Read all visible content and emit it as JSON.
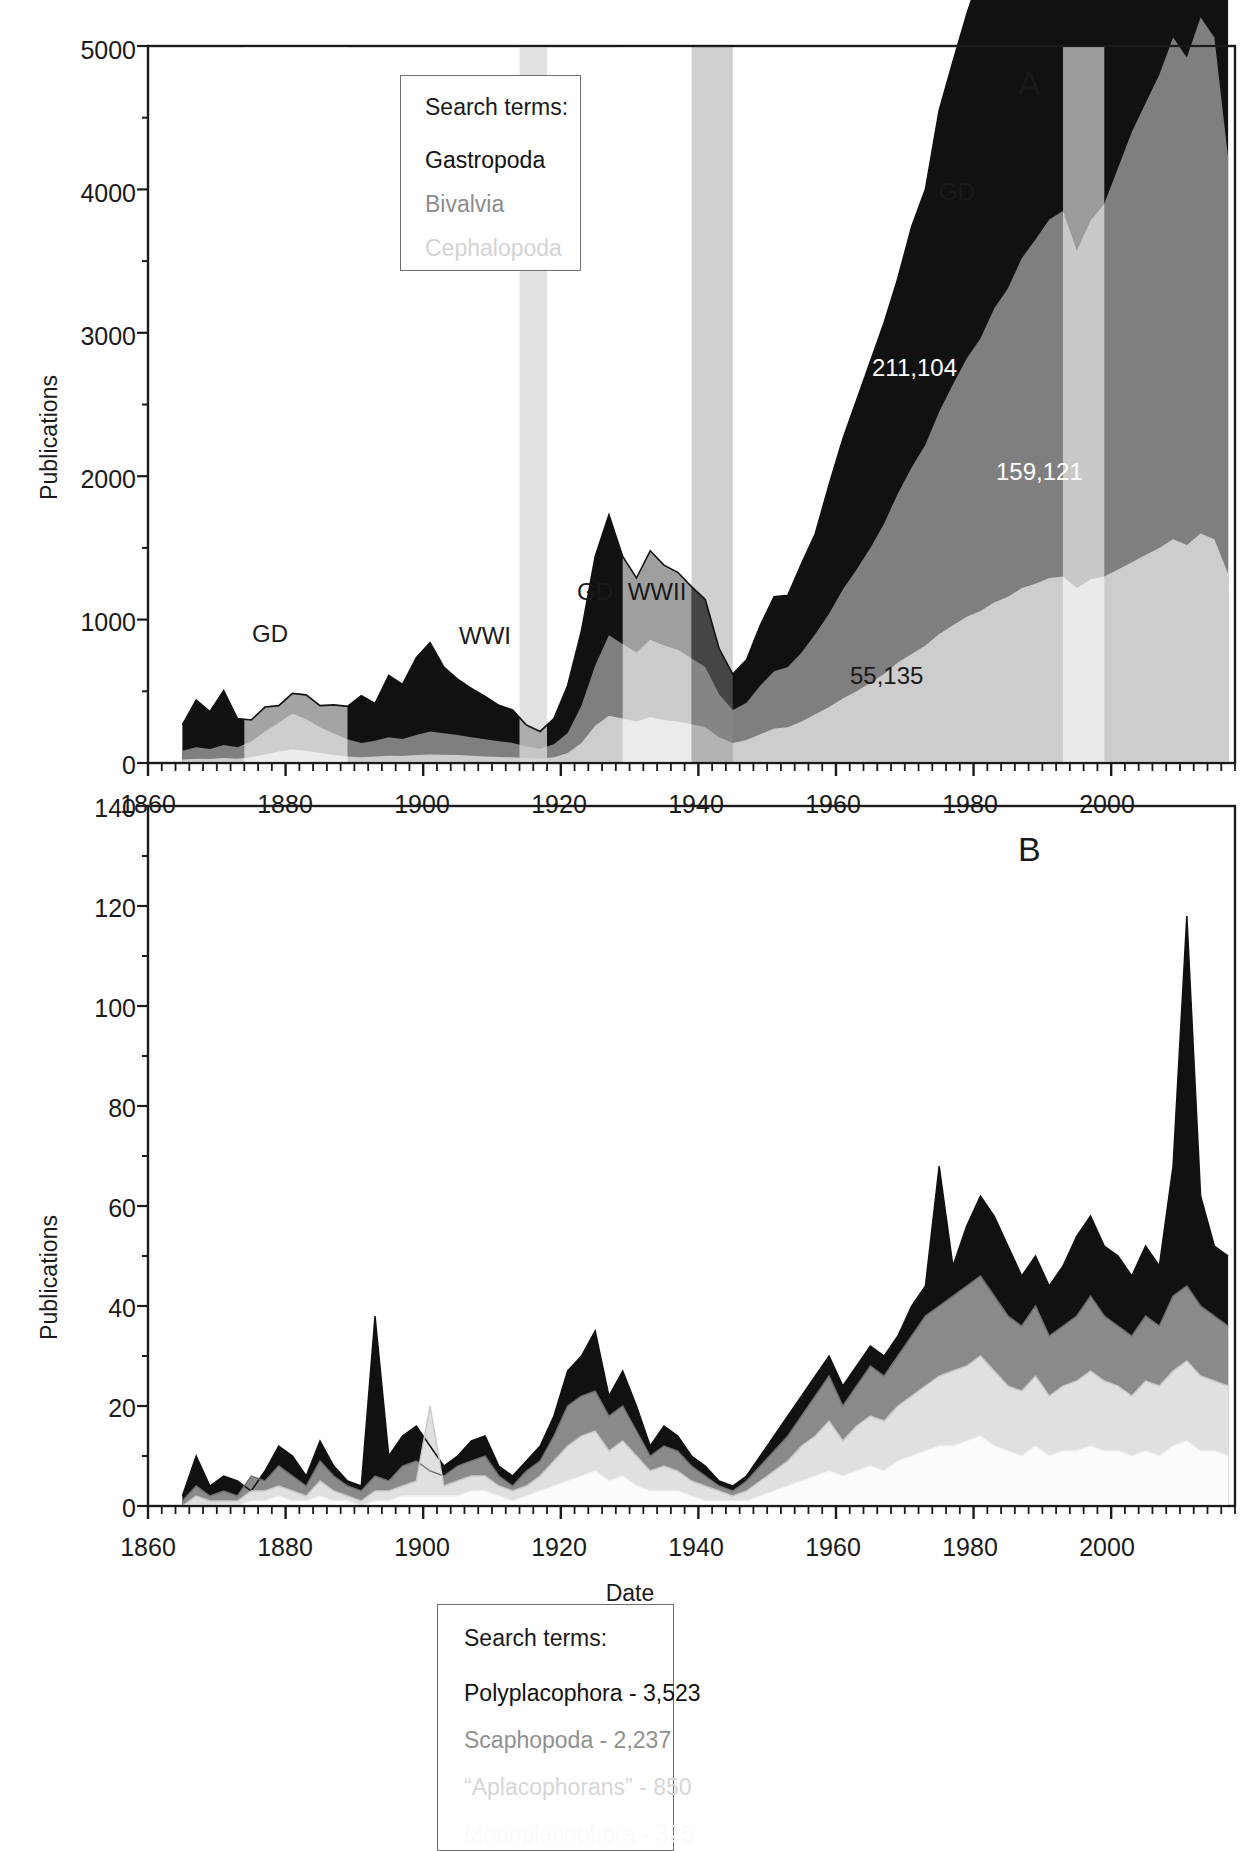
{
  "figure": {
    "panels": [
      "A",
      "B"
    ],
    "shared_xlabel": "Date"
  },
  "panelA": {
    "letter": "A",
    "ylabel": "Publications",
    "legend": {
      "title": "Search terms:",
      "entries": [
        {
          "label": "Gastropoda",
          "color": "#111111"
        },
        {
          "label": "Bivalvia",
          "color": "#7f7f7f"
        },
        {
          "label": "Cephalopoda",
          "color": "#cdcdcd"
        }
      ]
    },
    "event_bands": [
      {
        "label": "GD",
        "start": 1874,
        "end": 1889,
        "shade": "#ececec"
      },
      {
        "label": "WWI",
        "start": 1914,
        "end": 1918,
        "shade": "#bdbdbd"
      },
      {
        "label": "GD",
        "start": 1929,
        "end": 1939,
        "shade": "#ececec"
      },
      {
        "label": "WWII",
        "start": 1939,
        "end": 1945,
        "shade": "#b0b0b0"
      },
      {
        "label": "GD",
        "start": 1993,
        "end": 1999,
        "shade": "#e2e2e2"
      }
    ],
    "annotations": [
      {
        "text": "211,104",
        "series": "Gastropoda",
        "color": "#ffffff"
      },
      {
        "text": "159,121",
        "series": "Bivalvia",
        "color": "#ffffff"
      },
      {
        "text": "55,135",
        "series": "Cephalopoda",
        "color": "#2a2a2a"
      }
    ],
    "yticks": [
      0,
      1000,
      2000,
      3000,
      4000,
      5000
    ],
    "xticks": [
      1860,
      1880,
      1900,
      1920,
      1940,
      1960,
      1980,
      2000
    ]
  },
  "panelB": {
    "letter": "B",
    "ylabel": "Publications",
    "xlabel": "Date",
    "legend": {
      "title": "Search terms:",
      "entries": [
        {
          "label": "Polyplacophora - 3,523",
          "color": "#111111"
        },
        {
          "label": "Scaphopoda - 2,237",
          "color": "#8a8a8a"
        },
        {
          "label": "“Aplacophorans” - 850",
          "color": "#d2d2d2"
        },
        {
          "label": "Monoplacophora - 325",
          "color": "#fbfbfb"
        }
      ]
    },
    "yticks": [
      0,
      20,
      40,
      60,
      80,
      100,
      120,
      140
    ],
    "xticks": [
      1860,
      1880,
      1900,
      1920,
      1940,
      1960,
      1980,
      2000
    ]
  },
  "chart_data": [
    {
      "type": "area",
      "panel": "A",
      "title": "",
      "xlabel": "Date",
      "ylabel": "Publications",
      "xlim": [
        1860,
        2018
      ],
      "ylim": [
        0,
        5000
      ],
      "stacked": true,
      "grid": false,
      "legend_position": "upper-left-inside",
      "x": [
        1865,
        1867,
        1869,
        1871,
        1873,
        1875,
        1877,
        1879,
        1881,
        1883,
        1885,
        1887,
        1889,
        1891,
        1893,
        1895,
        1897,
        1899,
        1901,
        1903,
        1905,
        1907,
        1909,
        1911,
        1913,
        1915,
        1917,
        1919,
        1921,
        1923,
        1925,
        1927,
        1929,
        1931,
        1933,
        1935,
        1937,
        1939,
        1941,
        1943,
        1945,
        1947,
        1949,
        1951,
        1953,
        1955,
        1957,
        1959,
        1961,
        1963,
        1965,
        1967,
        1969,
        1971,
        1973,
        1975,
        1977,
        1979,
        1981,
        1983,
        1985,
        1987,
        1989,
        1991,
        1993,
        1995,
        1997,
        1999,
        2001,
        2003,
        2005,
        2007,
        2009,
        2011,
        2013,
        2015,
        2017
      ],
      "series": [
        {
          "name": "Gastropoda",
          "color": "#111111",
          "values": [
            180,
            330,
            260,
            380,
            200,
            150,
            170,
            120,
            140,
            170,
            150,
            200,
            230,
            330,
            260,
            430,
            380,
            540,
            620,
            460,
            390,
            340,
            300,
            250,
            230,
            150,
            120,
            180,
            330,
            520,
            760,
            840,
            610,
            520,
            620,
            560,
            540,
            500,
            470,
            320,
            250,
            300,
            420,
            520,
            500,
            620,
            700,
            900,
            1050,
            1180,
            1300,
            1400,
            1500,
            1680,
            1780,
            2100,
            2250,
            2400,
            2550,
            2800,
            2950,
            3200,
            3300,
            3400,
            3450,
            2980,
            3050,
            3100,
            3400,
            3600,
            3800,
            4050,
            4300,
            4150,
            4450,
            4300,
            3450
          ]
        },
        {
          "name": "Bivalvia",
          "color": "#7f7f7f",
          "values": [
            60,
            80,
            70,
            90,
            80,
            110,
            160,
            200,
            250,
            220,
            180,
            150,
            120,
            100,
            110,
            130,
            120,
            140,
            160,
            150,
            140,
            130,
            120,
            110,
            100,
            80,
            70,
            90,
            140,
            260,
            420,
            560,
            520,
            480,
            540,
            520,
            500,
            460,
            420,
            300,
            230,
            260,
            340,
            400,
            420,
            480,
            560,
            650,
            760,
            850,
            940,
            1050,
            1180,
            1300,
            1400,
            1550,
            1680,
            1800,
            1900,
            2050,
            2150,
            2300,
            2400,
            2500,
            2550,
            2350,
            2500,
            2600,
            2800,
            3000,
            3150,
            3300,
            3500,
            3400,
            3600,
            3500,
            2900
          ]
        },
        {
          "name": "Cephalopoda",
          "color": "#cdcdcd",
          "values": [
            25,
            30,
            28,
            35,
            30,
            40,
            60,
            80,
            95,
            85,
            70,
            55,
            45,
            40,
            45,
            50,
            48,
            55,
            60,
            58,
            55,
            50,
            45,
            42,
            40,
            35,
            30,
            40,
            70,
            140,
            260,
            330,
            310,
            290,
            320,
            300,
            290,
            270,
            250,
            180,
            140,
            160,
            200,
            240,
            250,
            290,
            340,
            390,
            450,
            500,
            560,
            620,
            700,
            760,
            820,
            900,
            960,
            1020,
            1060,
            1120,
            1160,
            1220,
            1250,
            1290,
            1300,
            1220,
            1280,
            1300,
            1350,
            1400,
            1450,
            1500,
            1560,
            1520,
            1600,
            1560,
            1320
          ]
        }
      ],
      "annotations": [
        {
          "text": "211,104",
          "x": 1983,
          "y": 2750
        },
        {
          "text": "159,121",
          "x": 2001,
          "y": 1800
        },
        {
          "text": "55,135",
          "x": 1972,
          "y": 500
        }
      ],
      "event_bands": [
        {
          "label": "GD",
          "start": 1874,
          "end": 1889
        },
        {
          "label": "WWI",
          "start": 1914,
          "end": 1918
        },
        {
          "label": "GD",
          "start": 1929,
          "end": 1939
        },
        {
          "label": "WWII",
          "start": 1939,
          "end": 1945
        },
        {
          "label": "GD",
          "start": 1993,
          "end": 1999
        }
      ]
    },
    {
      "type": "area",
      "panel": "B",
      "title": "",
      "xlabel": "Date",
      "ylabel": "Publications",
      "xlim": [
        1860,
        2018
      ],
      "ylim": [
        0,
        140
      ],
      "stacked": false,
      "grid": false,
      "legend_position": "upper-left-inside",
      "x": [
        1865,
        1867,
        1869,
        1871,
        1873,
        1875,
        1877,
        1879,
        1881,
        1883,
        1885,
        1887,
        1889,
        1891,
        1893,
        1895,
        1897,
        1899,
        1901,
        1903,
        1905,
        1907,
        1909,
        1911,
        1913,
        1915,
        1917,
        1919,
        1921,
        1923,
        1925,
        1927,
        1929,
        1931,
        1933,
        1935,
        1937,
        1939,
        1941,
        1943,
        1945,
        1947,
        1949,
        1951,
        1953,
        1955,
        1957,
        1959,
        1961,
        1963,
        1965,
        1967,
        1969,
        1971,
        1973,
        1975,
        1977,
        1979,
        1981,
        1983,
        1985,
        1987,
        1989,
        1991,
        1993,
        1995,
        1997,
        1999,
        2001,
        2003,
        2005,
        2007,
        2009,
        2011,
        2013,
        2015,
        2017
      ],
      "series": [
        {
          "name": "Polyplacophora",
          "color": "#111111",
          "values": [
            2,
            10,
            4,
            6,
            5,
            3,
            7,
            12,
            10,
            6,
            13,
            8,
            5,
            4,
            38,
            10,
            14,
            16,
            12,
            8,
            10,
            13,
            14,
            8,
            6,
            9,
            12,
            18,
            27,
            30,
            35,
            22,
            27,
            20,
            12,
            16,
            14,
            10,
            8,
            5,
            4,
            6,
            10,
            14,
            18,
            22,
            26,
            30,
            24,
            28,
            32,
            30,
            34,
            40,
            44,
            68,
            48,
            56,
            62,
            58,
            52,
            46,
            50,
            44,
            48,
            54,
            58,
            52,
            50,
            46,
            52,
            48,
            68,
            118,
            62,
            52,
            50
          ]
        },
        {
          "name": "Scaphopoda",
          "color": "#8a8a8a",
          "values": [
            1,
            4,
            2,
            3,
            2,
            6,
            5,
            8,
            6,
            4,
            9,
            6,
            4,
            3,
            6,
            5,
            8,
            9,
            7,
            6,
            8,
            9,
            10,
            6,
            4,
            7,
            9,
            14,
            20,
            22,
            23,
            18,
            20,
            15,
            10,
            12,
            11,
            8,
            6,
            4,
            3,
            5,
            8,
            11,
            14,
            18,
            22,
            26,
            20,
            24,
            28,
            26,
            30,
            34,
            38,
            40,
            42,
            44,
            46,
            42,
            38,
            36,
            40,
            34,
            36,
            38,
            42,
            38,
            36,
            34,
            38,
            36,
            42,
            44,
            40,
            38,
            36
          ]
        },
        {
          "name": "“Aplacophorans”",
          "color": "#d2d2d2",
          "values": [
            0,
            2,
            1,
            1,
            1,
            3,
            3,
            4,
            3,
            2,
            5,
            3,
            2,
            1,
            3,
            3,
            4,
            5,
            20,
            4,
            5,
            6,
            6,
            4,
            3,
            4,
            6,
            9,
            12,
            14,
            15,
            11,
            13,
            10,
            7,
            8,
            7,
            5,
            4,
            3,
            2,
            3,
            5,
            7,
            9,
            12,
            14,
            17,
            13,
            16,
            18,
            17,
            20,
            22,
            24,
            26,
            27,
            28,
            30,
            27,
            24,
            23,
            26,
            22,
            24,
            25,
            27,
            25,
            24,
            22,
            25,
            24,
            27,
            29,
            26,
            25,
            24
          ]
        },
        {
          "name": "Monoplacophora",
          "color": "#fbfbfb",
          "values": [
            0,
            0,
            0,
            0,
            0,
            1,
            1,
            2,
            1,
            1,
            2,
            1,
            1,
            0,
            1,
            1,
            2,
            2,
            2,
            2,
            2,
            3,
            3,
            2,
            1,
            2,
            3,
            4,
            5,
            6,
            7,
            5,
            6,
            4,
            3,
            3,
            3,
            2,
            1,
            1,
            1,
            1,
            2,
            3,
            4,
            5,
            6,
            7,
            6,
            7,
            8,
            7,
            9,
            10,
            11,
            12,
            12,
            13,
            14,
            12,
            11,
            10,
            12,
            10,
            11,
            11,
            12,
            11,
            11,
            10,
            11,
            10,
            12,
            13,
            11,
            11,
            10
          ]
        }
      ]
    }
  ]
}
